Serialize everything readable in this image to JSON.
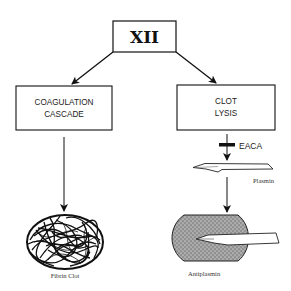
{
  "diagram": {
    "root": {
      "label": "XII"
    },
    "left_branch": {
      "box_line1": "COAGULATION",
      "box_line2": "CASCADE",
      "result_label": "Fibrin Clot"
    },
    "right_branch": {
      "box_line1": "CLOT",
      "box_line2": "LYSIS",
      "inhibitor_label": "EACA",
      "enzyme_label": "Plasmin",
      "result_label": "Antiplasmin"
    }
  }
}
